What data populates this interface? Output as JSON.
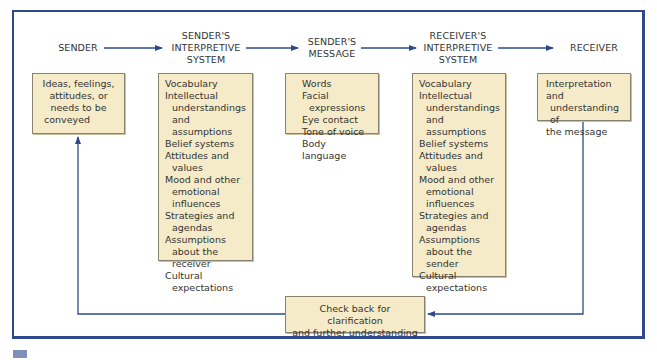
{
  "colors": {
    "frame": "#2e4a8c",
    "arrow": "#2e4a8c",
    "box_fill": "#f5ebc8",
    "box_border": "#8a8270",
    "text": "#333333"
  },
  "stages": [
    {
      "heading": [
        "SENDER"
      ],
      "box_lines": [
        {
          "text": "Ideas, feelings,",
          "indent": false
        },
        {
          "text": "attitudes, or",
          "indent": false
        },
        {
          "text": "needs to be",
          "indent": false
        },
        {
          "text": "conveyed",
          "indent": false
        }
      ]
    },
    {
      "heading": [
        "SENDER'S",
        "INTERPRETIVE",
        "SYSTEM"
      ],
      "box_lines": [
        {
          "text": "Vocabulary",
          "indent": false
        },
        {
          "text": "Intellectual",
          "indent": false
        },
        {
          "text": "understandings",
          "indent": true
        },
        {
          "text": "and assumptions",
          "indent": true
        },
        {
          "text": "Belief systems",
          "indent": false
        },
        {
          "text": "Attitudes and",
          "indent": false
        },
        {
          "text": "values",
          "indent": true
        },
        {
          "text": "Mood and other",
          "indent": false
        },
        {
          "text": "emotional",
          "indent": true
        },
        {
          "text": "influences",
          "indent": true
        },
        {
          "text": "Strategies and",
          "indent": false
        },
        {
          "text": "agendas",
          "indent": true
        },
        {
          "text": "Assumptions",
          "indent": false
        },
        {
          "text": "about the",
          "indent": true
        },
        {
          "text": "receiver",
          "indent": true
        },
        {
          "text": "Cultural",
          "indent": false
        },
        {
          "text": "expectations",
          "indent": true
        }
      ]
    },
    {
      "heading": [
        "SENDER'S",
        "MESSAGE"
      ],
      "box_lines": [
        {
          "text": "Words",
          "indent": false
        },
        {
          "text": "Facial",
          "indent": false
        },
        {
          "text": "expressions",
          "indent": true
        },
        {
          "text": "Eye contact",
          "indent": false
        },
        {
          "text": "Tone of voice",
          "indent": false
        },
        {
          "text": "Body language",
          "indent": false
        }
      ]
    },
    {
      "heading": [
        "RECEIVER'S",
        "INTERPRETIVE",
        "SYSTEM"
      ],
      "box_lines": [
        {
          "text": "Vocabulary",
          "indent": false
        },
        {
          "text": "Intellectual",
          "indent": false
        },
        {
          "text": "understandings",
          "indent": true
        },
        {
          "text": "and assumptions",
          "indent": true
        },
        {
          "text": "Belief systems",
          "indent": false
        },
        {
          "text": "Attitudes and",
          "indent": false
        },
        {
          "text": "values",
          "indent": true
        },
        {
          "text": "Mood and other",
          "indent": false
        },
        {
          "text": "emotional",
          "indent": true
        },
        {
          "text": "influences",
          "indent": true
        },
        {
          "text": "Strategies and",
          "indent": false
        },
        {
          "text": "agendas",
          "indent": true
        },
        {
          "text": "Assumptions",
          "indent": false
        },
        {
          "text": "about the sender",
          "indent": true
        },
        {
          "text": "Cultural",
          "indent": false
        },
        {
          "text": "expectations",
          "indent": true
        }
      ]
    },
    {
      "heading": [
        "RECEIVER"
      ],
      "box_lines": [
        {
          "text": "Interpretation and",
          "indent": false
        },
        {
          "text": "understanding of",
          "indent": true
        },
        {
          "text": "the message",
          "indent": false
        }
      ]
    }
  ],
  "feedback": {
    "lines": [
      "Check back for clarification",
      "and further understanding"
    ]
  }
}
